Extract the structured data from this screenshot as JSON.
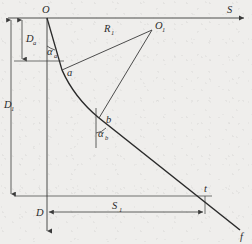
{
  "figure": {
    "background_color": "#efeeec",
    "line_color": "#3a3a3a",
    "curve_color": "#2a2a2a",
    "width": 252,
    "height": 244
  },
  "axes": {
    "horizontal": {
      "label": "S",
      "name": "horizontal-displacement-axis",
      "arrow": "right"
    },
    "vertical": {
      "label": "D",
      "name": "vertical-depth-axis",
      "arrow": "down"
    }
  },
  "points": {
    "origin": {
      "label": "O",
      "x": 47,
      "y": 18
    },
    "kickoff": {
      "label": "a",
      "x": 62,
      "y": 70
    },
    "tangent": {
      "label": "b",
      "x": 99,
      "y": 118
    },
    "center": {
      "label": "O",
      "sub": "1",
      "x": 152,
      "y": 30
    },
    "target": {
      "label": "t",
      "x": 205,
      "y": 196
    },
    "bottom": {
      "label": "f",
      "x": 240,
      "y": 232
    }
  },
  "dimensions": [
    {
      "name": "vertical-depth-to-kickoff",
      "label": "D",
      "sub": "a"
    },
    {
      "name": "total-vertical-depth",
      "label": "D",
      "sub": "1"
    },
    {
      "name": "horizontal-displacement",
      "label": "S",
      "sub": "1"
    }
  ],
  "radii": [
    {
      "name": "build-radius",
      "label": "R",
      "sub": "1"
    }
  ],
  "angles": [
    {
      "name": "inclination-at-a",
      "label": "α",
      "sub": "a"
    },
    {
      "name": "inclination-at-b",
      "label": "α",
      "sub": "b"
    }
  ]
}
